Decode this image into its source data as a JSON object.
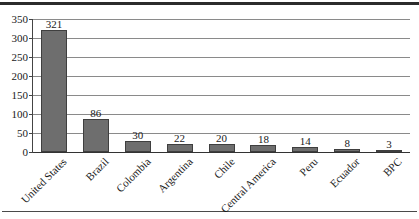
{
  "chart_data": {
    "type": "bar",
    "title": "",
    "subtitle": "",
    "xlabel": "",
    "ylabel": "",
    "ylim": [
      0,
      350
    ],
    "ytick_step": 50,
    "yticks": [
      0,
      50,
      100,
      150,
      200,
      250,
      300,
      350
    ],
    "ytick_labels": [
      "0",
      "50",
      "100",
      "150",
      "200",
      "250",
      "300",
      "350"
    ],
    "grid": true,
    "grid_axis": "y",
    "legend": false,
    "legend_position": "none",
    "categories": [
      "United States",
      "Brazil",
      "Colombia",
      "Argentina",
      "Chile",
      "Central America",
      "Peru",
      "Ecuador",
      "BPC"
    ],
    "values": [
      321,
      86,
      30,
      22,
      20,
      18,
      14,
      8,
      3
    ],
    "data_labels": [
      "321",
      "86",
      "30",
      "22",
      "20",
      "18",
      "14",
      "8",
      "3"
    ],
    "series": [
      {
        "name": "",
        "values": [
          321,
          86,
          30,
          22,
          20,
          18,
          14,
          8,
          3
        ]
      }
    ],
    "colors": {
      "bar_fill": "#6e6e6e",
      "bar_border": "#3f3f3f",
      "gridline": "#8a8a8a",
      "axis": "#333333",
      "text": "#1a1a1a",
      "background": "#ffffff",
      "rule": "#2b2b2b"
    },
    "xtick_label_rotation": -45
  }
}
